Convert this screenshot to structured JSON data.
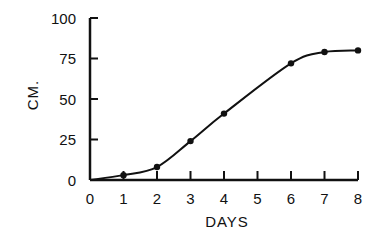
{
  "chart_data": {
    "type": "line",
    "title": "",
    "xlabel": "DAYS",
    "ylabel": "CM.",
    "x_ticks": [
      0,
      1,
      2,
      3,
      4,
      5,
      6,
      7,
      8
    ],
    "y_ticks": [
      0,
      25,
      50,
      75,
      100
    ],
    "xlim": [
      0,
      8
    ],
    "ylim": [
      0,
      100
    ],
    "grid": false,
    "legend": null,
    "series": [
      {
        "name": "growth",
        "markers": true,
        "smooth_curve": true,
        "x": [
          1,
          2,
          3,
          4,
          6,
          7,
          8
        ],
        "values": [
          3,
          8,
          24,
          41,
          72,
          79,
          80
        ]
      }
    ],
    "colors": {
      "ink": "#111111",
      "background": "#ffffff"
    }
  }
}
